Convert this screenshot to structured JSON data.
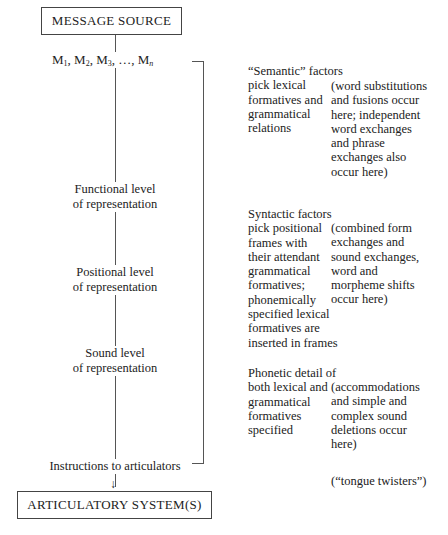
{
  "diagram": {
    "top_box": "MESSAGE SOURCE",
    "messages": {
      "base": "M",
      "subs": [
        "1",
        "2",
        "3"
      ],
      "ellipsis": "…",
      "last_sub": "n"
    },
    "levels": [
      {
        "line1": "Functional level",
        "line2": "of representation"
      },
      {
        "line1": "Positional level",
        "line2": "of representation"
      },
      {
        "line1": "Sound level",
        "line2": "of representation"
      }
    ],
    "instructions": "Instructions to articulators",
    "bottom_box": "ARTICULATORY SYSTEM(S)",
    "factors": [
      "“Semantic” factors\npick lexical\nformatives and\ngrammatical\nrelations",
      "Syntactic factors\npick positional\nframes with\ntheir attendant\ngrammatical\nformatives;\nphonemically\nspecified lexical\nformatives are\ninserted in frames",
      "Phonetic detail of\nboth lexical and\ngrammatical\nformatives\nspecified"
    ],
    "errors": [
      "(word substitutions\nand fusions occur\nhere; independent\nword exchanges\nand phrase\nexchanges also\noccur here)",
      "(combined form\nexchanges and\nsound exchanges,\nword and\nmorpheme shifts\noccur here)",
      "(accommodations\nand simple and\ncomplex sound\ndeletions occur\nhere)",
      "(“tongue twisters”)"
    ],
    "arrow_glyph": "↓"
  }
}
